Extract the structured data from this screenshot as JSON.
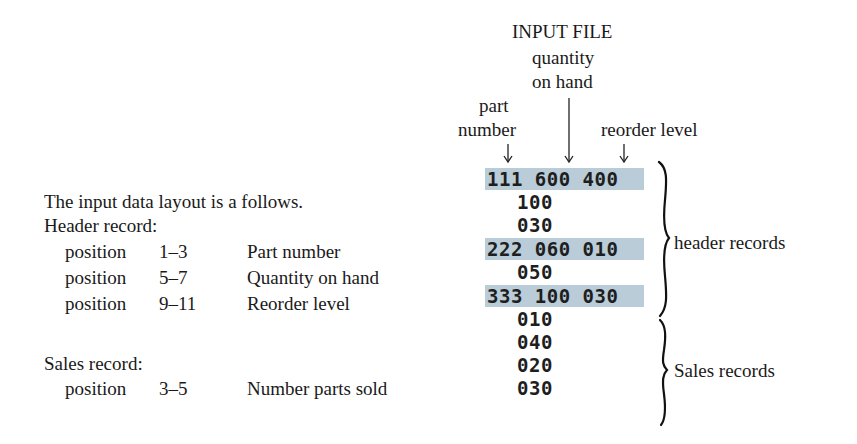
{
  "diagram": {
    "title": "INPUT FILE",
    "column_labels": {
      "part_number": [
        "part",
        "number"
      ],
      "quantity_on_hand": [
        "quantity",
        "on hand"
      ],
      "reorder_level": "reorder level"
    },
    "records": [
      {
        "text": "111 600 400",
        "type": "header",
        "highlight": true
      },
      {
        "text": "100",
        "type": "header",
        "highlight": false
      },
      {
        "text": "030",
        "type": "header",
        "highlight": false
      },
      {
        "text": "222 060 010",
        "type": "header",
        "highlight": true
      },
      {
        "text": "050",
        "type": "header",
        "highlight": false
      },
      {
        "text": "333 100 030",
        "type": "header",
        "highlight": true
      },
      {
        "text": "010",
        "type": "sales",
        "highlight": false
      },
      {
        "text": "040",
        "type": "sales",
        "highlight": false
      },
      {
        "text": "020",
        "type": "sales",
        "highlight": false
      },
      {
        "text": "030",
        "type": "sales",
        "highlight": false
      }
    ],
    "brace_labels": {
      "header": "header records",
      "sales": "Sales records"
    },
    "highlight_color": "#b9ccd8"
  },
  "description": {
    "intro": "The input data layout is a follows.",
    "header_record": {
      "title": "Header record:",
      "fields": [
        {
          "label": "position",
          "range": "1–3",
          "name": "Part number"
        },
        {
          "label": "position",
          "range": "5–7",
          "name": "Quantity on hand"
        },
        {
          "label": "position",
          "range": "9–11",
          "name": "Reorder level"
        }
      ]
    },
    "sales_record": {
      "title": "Sales record:",
      "fields": [
        {
          "label": "position",
          "range": "3–5",
          "name": "Number parts sold"
        }
      ]
    }
  }
}
